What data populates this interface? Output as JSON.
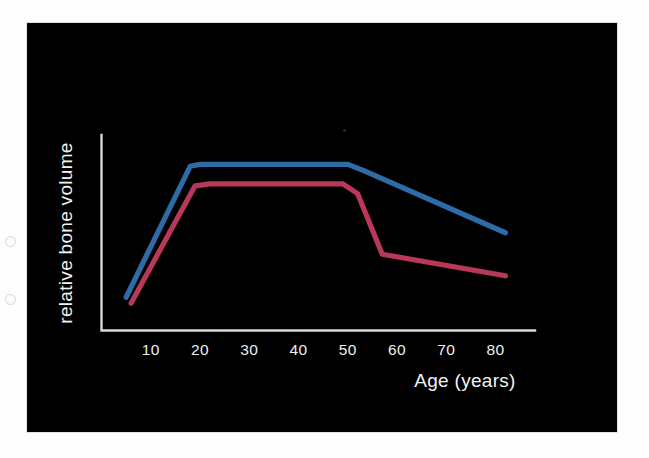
{
  "figure": {
    "background_color": "#000000",
    "page_color": "#fdfdfd",
    "artifacts": {
      "hole_1_name": "punch-hole-artifact",
      "hole_2_name": "punch-hole-artifact",
      "speck_name": "scan-speck-artifact"
    }
  },
  "axes": {
    "x_title": "Age (years)",
    "y_title": "relative bone volume",
    "x_tick_labels": [
      "10",
      "20",
      "30",
      "40",
      "50",
      "60",
      "70",
      "80"
    ],
    "axis_color": "#d8d8d8",
    "tick_text_color": "#efefef"
  },
  "chart_data": {
    "type": "line",
    "title": "",
    "subtitle": "",
    "xlabel": "Age (years)",
    "ylabel": "relative bone volume",
    "xlim": [
      0,
      88
    ],
    "ylim": [
      0,
      1
    ],
    "grid": false,
    "legend": "none",
    "x_ticks": [
      10,
      20,
      30,
      40,
      50,
      60,
      70,
      80
    ],
    "y_ticks": [],
    "y_axis_labeled": false,
    "annotations": [],
    "series": [
      {
        "name": "upper curve",
        "color": "#2e6ca8",
        "x": [
          5,
          18,
          20,
          50,
          53,
          82
        ],
        "values": [
          0.17,
          0.84,
          0.85,
          0.85,
          0.82,
          0.5
        ],
        "description": "rises steeply from age 5 to peak at ~18, plateaus to age 50, then declines gradually to age 82"
      },
      {
        "name": "lower curve",
        "color": "#b8385a",
        "x": [
          6,
          19,
          22,
          49,
          52,
          57,
          82
        ],
        "values": [
          0.14,
          0.74,
          0.75,
          0.75,
          0.7,
          0.39,
          0.28
        ],
        "description": "rises steeply from age 6 to peak at ~19, plateaus to age 49, drops sharply to age 57, then declines gradually to age 82"
      }
    ]
  }
}
